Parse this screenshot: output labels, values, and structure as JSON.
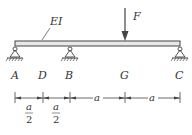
{
  "beam": {
    "label": "EI",
    "x_start": 15,
    "x_end": 180,
    "y_top": 41,
    "y_bottom": 46,
    "color": "#555555"
  },
  "load": {
    "label": "F",
    "x": 125,
    "y_start": 8,
    "y_end": 40
  },
  "points": [
    {
      "label": "A",
      "x": 15,
      "support": "pin"
    },
    {
      "label": "D",
      "x": 43,
      "support": "none"
    },
    {
      "label": "B",
      "x": 70,
      "support": "pin"
    },
    {
      "label": "G",
      "x": 125,
      "support": "none"
    },
    {
      "label": "C",
      "x": 180,
      "support": "pin"
    }
  ],
  "dimensions": [
    {
      "from": 15,
      "to": 43,
      "label_num": "a",
      "label_den": "2"
    },
    {
      "from": 43,
      "to": 70,
      "label_num": "a",
      "label_den": "2"
    },
    {
      "from": 70,
      "to": 125,
      "label": "a"
    },
    {
      "from": 125,
      "to": 180,
      "label": "a"
    }
  ]
}
